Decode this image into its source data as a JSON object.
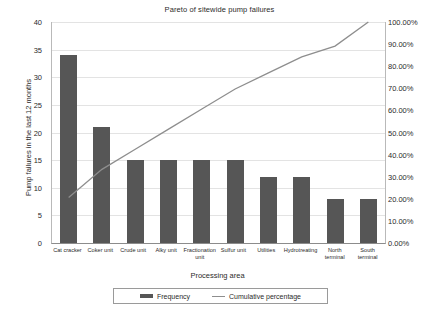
{
  "chart_data": {
    "type": "bar",
    "title": "Pareto of sitewide pump failures",
    "xlabel": "Processing area",
    "ylabel": "Pump failures in the last 12 months",
    "y2label": "",
    "ylim": [
      0,
      40
    ],
    "y2lim": [
      0,
      100
    ],
    "grid": true,
    "legend_position": "bottom",
    "categories": [
      "Cat cracker",
      "Coker unit",
      "Crude unit",
      "Alky unit",
      "Fractionation unit",
      "Sulfur unit",
      "Utilities",
      "Hydrotreating",
      "North terminal",
      "South terminal"
    ],
    "series": [
      {
        "name": "Frequency",
        "type": "bar",
        "axis": "left",
        "color": "#565656",
        "values": [
          34,
          21,
          15,
          15,
          15,
          15,
          12,
          12,
          8,
          8
        ]
      },
      {
        "name": "Cumulative percentage",
        "type": "line",
        "axis": "right",
        "color": "#8e8e8e",
        "values": [
          20.61,
          33.33,
          42.42,
          51.52,
          60.61,
          69.7,
          76.97,
          84.24,
          89.09,
          100.0
        ]
      }
    ],
    "total_failures": 165,
    "y_ticks": [
      "0",
      "5",
      "10",
      "15",
      "20",
      "25",
      "30",
      "35",
      "40"
    ],
    "y2_ticks": [
      "0.00%",
      "10.00%",
      "20.00%",
      "30.00%",
      "40.00%",
      "50.00%",
      "60.00%",
      "70.00%",
      "80.00%",
      "90.00%",
      "100.00%"
    ],
    "legend": [
      "Frequency",
      "Cumulative percentage"
    ]
  }
}
